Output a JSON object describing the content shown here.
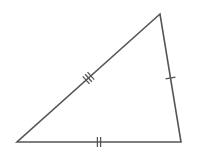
{
  "diagram": {
    "type": "triangle",
    "stroke_color": "#555555",
    "background": "#ffffff",
    "vertices": {
      "top": [
        160,
        14
      ],
      "bottom_left": [
        17,
        142
      ],
      "bottom_right": [
        181,
        142
      ]
    },
    "sides": [
      {
        "name": "left",
        "from": "bottom_left",
        "to": "top",
        "tick_marks": 3
      },
      {
        "name": "right",
        "from": "top",
        "to": "bottom_right",
        "tick_marks": 1
      },
      {
        "name": "base",
        "from": "bottom_left",
        "to": "bottom_right",
        "tick_marks": 2
      }
    ]
  }
}
